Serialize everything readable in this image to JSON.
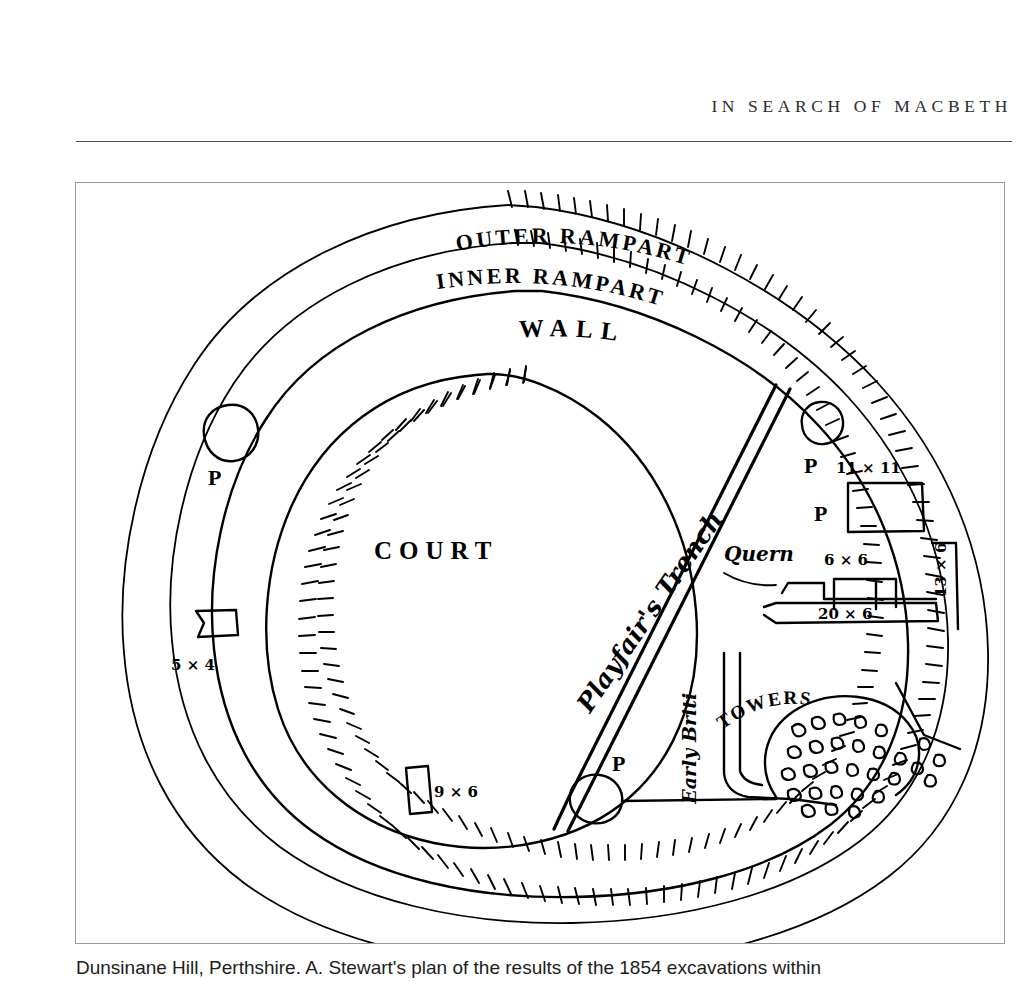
{
  "page": {
    "running_head": "IN SEARCH OF MACBETH",
    "caption": "Dunsinane Hill, Perthshire. A. Stewart's plan of the results of the 1854 excavations within"
  },
  "figure": {
    "labels": {
      "outer_rampart": "OUTER RAMPART",
      "inner_rampart": "INNER RAMPART",
      "wall": "WALL",
      "court": "COURT",
      "trench": "Playfair's Trench",
      "quern": "Quern",
      "early_british": "Early British",
      "towers": "TOWERS"
    },
    "pit_marker": "P",
    "pit_markers": [
      {
        "id": "pit-west",
        "label": "P"
      },
      {
        "id": "pit-northeast",
        "label": "P"
      },
      {
        "id": "pit-chamber-east",
        "label": "P"
      },
      {
        "id": "pit-south",
        "label": "P"
      }
    ],
    "dimensions": [
      {
        "id": "chamber-west",
        "label": "5 × 4"
      },
      {
        "id": "chamber-south",
        "label": "9 × 6"
      },
      {
        "id": "chamber-ne-large",
        "label": "11 × 11"
      },
      {
        "id": "chamber-ne-small",
        "label": "6 × 6"
      },
      {
        "id": "chamber-gallery",
        "label": "20 × 6"
      },
      {
        "id": "chamber-east-side",
        "label": "13 × 6"
      }
    ]
  },
  "colors": {
    "ink": "#000000",
    "frame_border": "#9a9a9a",
    "rule": "#4a4a4a",
    "paper": "#ffffff",
    "header_text": "#2b2b2b"
  }
}
